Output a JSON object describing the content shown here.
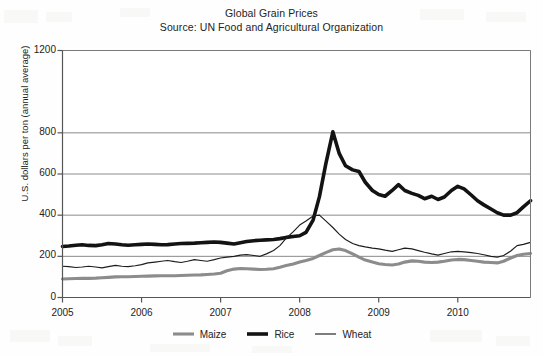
{
  "chart_data": {
    "type": "line",
    "title": "Global Grain Prices",
    "subtitle": "Source: UN Food and Agricultural Organization",
    "xlabel": "",
    "ylabel": "U.S. dollars per ton (annual average)",
    "xlim": [
      2005.0,
      2010.92
    ],
    "ylim": [
      0,
      1200
    ],
    "yticks": [
      0,
      200,
      400,
      600,
      800,
      1200
    ],
    "ytick_labels": [
      "0",
      "200",
      "400",
      "600",
      "800",
      "1200"
    ],
    "xticks": [
      2005,
      2006,
      2007,
      2008,
      2009,
      2010
    ],
    "xtick_labels": [
      "2005",
      "2006",
      "2007",
      "2008",
      "2009",
      "2010"
    ],
    "grid": "horizontal",
    "legend_position": "bottom",
    "series": [
      {
        "name": "Maize",
        "color": "#8c8c8c",
        "width": 3.1,
        "x": [
          2005.0,
          2005.08,
          2005.17,
          2005.25,
          2005.33,
          2005.42,
          2005.5,
          2005.58,
          2005.67,
          2005.75,
          2005.83,
          2005.92,
          2006.0,
          2006.08,
          2006.17,
          2006.25,
          2006.33,
          2006.42,
          2006.5,
          2006.58,
          2006.67,
          2006.75,
          2006.83,
          2006.92,
          2007.0,
          2007.08,
          2007.17,
          2007.25,
          2007.33,
          2007.42,
          2007.5,
          2007.58,
          2007.67,
          2007.75,
          2007.83,
          2007.92,
          2008.0,
          2008.08,
          2008.17,
          2008.25,
          2008.33,
          2008.42,
          2008.5,
          2008.58,
          2008.67,
          2008.75,
          2008.83,
          2008.92,
          2009.0,
          2009.08,
          2009.17,
          2009.25,
          2009.33,
          2009.42,
          2009.5,
          2009.58,
          2009.67,
          2009.75,
          2009.83,
          2009.92,
          2010.0,
          2010.08,
          2010.17,
          2010.25,
          2010.33,
          2010.42,
          2010.5,
          2010.58,
          2010.67,
          2010.75,
          2010.83,
          2010.92
        ],
        "y": [
          90,
          91,
          92,
          93,
          93,
          94,
          96,
          98,
          100,
          101,
          101,
          102,
          103,
          104,
          105,
          106,
          106,
          106,
          107,
          108,
          109,
          110,
          112,
          114,
          118,
          130,
          138,
          141,
          140,
          138,
          136,
          137,
          140,
          147,
          155,
          163,
          172,
          180,
          190,
          204,
          218,
          232,
          236,
          228,
          212,
          196,
          182,
          172,
          164,
          160,
          158,
          163,
          172,
          178,
          176,
          172,
          170,
          172,
          176,
          182,
          185,
          184,
          180,
          176,
          172,
          170,
          168,
          176,
          192,
          204,
          210,
          214
        ]
      },
      {
        "name": "Rice",
        "color": "#131313",
        "width": 3.6,
        "x": [
          2005.0,
          2005.08,
          2005.17,
          2005.25,
          2005.33,
          2005.42,
          2005.5,
          2005.58,
          2005.67,
          2005.75,
          2005.83,
          2005.92,
          2006.0,
          2006.08,
          2006.17,
          2006.25,
          2006.33,
          2006.42,
          2006.5,
          2006.58,
          2006.67,
          2006.75,
          2006.83,
          2006.92,
          2007.0,
          2007.08,
          2007.17,
          2007.25,
          2007.33,
          2007.42,
          2007.5,
          2007.58,
          2007.67,
          2007.75,
          2007.83,
          2007.92,
          2008.0,
          2008.08,
          2008.17,
          2008.25,
          2008.33,
          2008.42,
          2008.5,
          2008.58,
          2008.67,
          2008.75,
          2008.83,
          2008.92,
          2009.0,
          2009.08,
          2009.17,
          2009.25,
          2009.33,
          2009.42,
          2009.5,
          2009.58,
          2009.67,
          2009.75,
          2009.83,
          2009.92,
          2010.0,
          2010.08,
          2010.17,
          2010.25,
          2010.33,
          2010.42,
          2010.5,
          2010.58,
          2010.67,
          2010.75,
          2010.83,
          2010.92
        ],
        "y": [
          248,
          250,
          254,
          256,
          253,
          252,
          256,
          262,
          260,
          256,
          254,
          256,
          258,
          260,
          258,
          256,
          257,
          260,
          262,
          263,
          264,
          266,
          268,
          270,
          268,
          264,
          260,
          266,
          272,
          276,
          278,
          280,
          282,
          286,
          292,
          296,
          300,
          316,
          376,
          490,
          648,
          805,
          700,
          640,
          620,
          612,
          560,
          520,
          500,
          492,
          520,
          548,
          520,
          506,
          496,
          480,
          492,
          476,
          488,
          520,
          540,
          528,
          498,
          470,
          450,
          430,
          412,
          400,
          400,
          412,
          440,
          470
        ]
      },
      {
        "name": "Wheat",
        "color": "#1d1d1d",
        "width": 1.15,
        "x": [
          2005.0,
          2005.08,
          2005.17,
          2005.25,
          2005.33,
          2005.42,
          2005.5,
          2005.58,
          2005.67,
          2005.75,
          2005.83,
          2005.92,
          2006.0,
          2006.08,
          2006.17,
          2006.25,
          2006.33,
          2006.42,
          2006.5,
          2006.58,
          2006.67,
          2006.75,
          2006.83,
          2006.92,
          2007.0,
          2007.08,
          2007.17,
          2007.25,
          2007.33,
          2007.42,
          2007.5,
          2007.58,
          2007.67,
          2007.75,
          2007.83,
          2007.92,
          2008.0,
          2008.08,
          2008.17,
          2008.25,
          2008.33,
          2008.42,
          2008.5,
          2008.58,
          2008.67,
          2008.75,
          2008.83,
          2008.92,
          2009.0,
          2009.08,
          2009.17,
          2009.25,
          2009.33,
          2009.42,
          2009.5,
          2009.58,
          2009.67,
          2009.75,
          2009.83,
          2009.92,
          2010.0,
          2010.08,
          2010.17,
          2010.25,
          2010.33,
          2010.42,
          2010.5,
          2010.58,
          2010.67,
          2010.75,
          2010.83,
          2010.92
        ],
        "y": [
          152,
          150,
          146,
          148,
          152,
          148,
          144,
          150,
          156,
          152,
          150,
          154,
          160,
          168,
          172,
          176,
          180,
          174,
          170,
          176,
          184,
          180,
          176,
          184,
          192,
          196,
          200,
          206,
          208,
          204,
          200,
          212,
          228,
          252,
          288,
          320,
          352,
          372,
          396,
          400,
          372,
          340,
          308,
          282,
          262,
          252,
          246,
          240,
          236,
          230,
          224,
          232,
          240,
          236,
          228,
          220,
          212,
          206,
          214,
          222,
          224,
          222,
          218,
          214,
          208,
          200,
          196,
          204,
          226,
          252,
          258,
          268
        ]
      }
    ]
  },
  "axis": {
    "frame_color": "#7a7a7a",
    "grid_color": "#8a8a8a",
    "text_color": "#232323"
  }
}
